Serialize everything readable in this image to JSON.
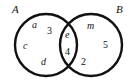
{
  "figure": {
    "type": "venn-diagram",
    "stroke_color": "#111111",
    "fill_color": "#ffffff",
    "background": "#ffffff",
    "sets": [
      {
        "id": "A",
        "label": "A",
        "label_position": "top-left-outside",
        "circle": {
          "cx": 46,
          "cy": 45,
          "r": 31
        }
      },
      {
        "id": "B",
        "label": "B",
        "label_position": "top-right-outside",
        "circle": {
          "cx": 91,
          "cy": 45,
          "r": 31
        }
      }
    ],
    "regions": {
      "a_only": [
        "a",
        "3",
        "c",
        "d"
      ],
      "intersection": [
        "e",
        "4"
      ],
      "b_only": [
        "m",
        "5",
        "2"
      ]
    },
    "members": {
      "a": "a",
      "three": "3",
      "c": "c",
      "d": "d",
      "e": "e",
      "four": "4",
      "m": "m",
      "five": "5",
      "two": "2"
    }
  }
}
